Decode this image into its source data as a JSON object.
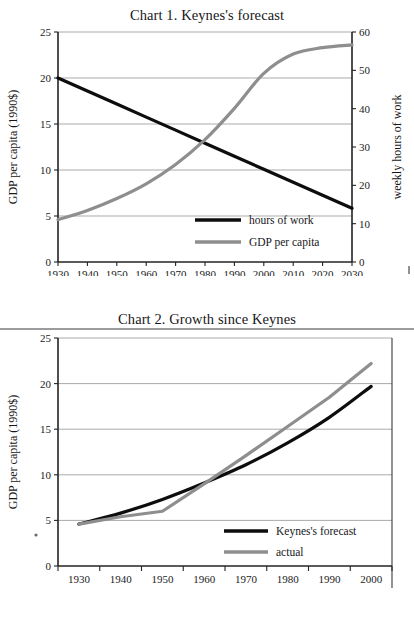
{
  "chart_data": [
    {
      "type": "line",
      "title": "Chart 1. Keynes's forecast",
      "xlabel": "",
      "ylabel": "GDP per capita (1990$)",
      "y2label": "weekly hours of work",
      "xlim": [
        1930,
        2030
      ],
      "ylim": [
        0,
        25
      ],
      "y2lim": [
        0,
        60
      ],
      "xticks": [
        1930,
        1940,
        1950,
        1960,
        1970,
        1980,
        1990,
        2000,
        2010,
        2020,
        2030
      ],
      "yticks": [
        0,
        5,
        10,
        15,
        20,
        25
      ],
      "y2ticks": [
        0,
        10,
        20,
        30,
        40,
        50,
        60
      ],
      "grid": "horizontal",
      "legend_position": "inside-bottom-center",
      "x": [
        1930,
        1940,
        1950,
        1960,
        1970,
        1980,
        1990,
        2000,
        2010,
        2020,
        2030
      ],
      "series": [
        {
          "name": "hours of work",
          "axis": "right",
          "color": "#0d0d0d",
          "units": "weekly hours",
          "values": [
            48.0,
            44.6,
            41.2,
            37.8,
            34.4,
            31.0,
            27.6,
            24.2,
            20.8,
            17.4,
            14.0
          ]
        },
        {
          "name": "GDP per capita",
          "axis": "left",
          "color": "#8e8e8e",
          "units": "1990$ thousands",
          "values": [
            4.6,
            5.6,
            6.9,
            8.5,
            10.6,
            13.3,
            16.7,
            20.5,
            22.6,
            23.3,
            23.6
          ]
        }
      ]
    },
    {
      "type": "line",
      "title": "Chart 2. Growth since Keynes",
      "xlabel": "",
      "ylabel": "GDP per capita (1990$)",
      "xlim": [
        1930,
        2000
      ],
      "ylim": [
        0,
        25
      ],
      "xticks": [
        1930,
        1940,
        1950,
        1960,
        1970,
        1980,
        1990,
        2000
      ],
      "yticks": [
        0,
        5,
        10,
        15,
        20,
        25
      ],
      "grid": "horizontal",
      "legend_position": "inside-bottom-center",
      "x": [
        1930,
        1940,
        1950,
        1960,
        1970,
        1980,
        1990,
        2000
      ],
      "series": [
        {
          "name": "Keynes's forecast",
          "color": "#0d0d0d",
          "units": "1990$ thousands",
          "values": [
            4.6,
            5.8,
            7.3,
            9.1,
            11.1,
            13.5,
            16.3,
            19.7
          ]
        },
        {
          "name": "actual",
          "color": "#8e8e8e",
          "units": "1990$ thousands",
          "values": [
            4.6,
            5.4,
            6.0,
            9.0,
            12.1,
            15.3,
            18.5,
            22.2
          ]
        }
      ]
    }
  ],
  "chart1": {
    "title": "Chart 1. Keynes's forecast",
    "y_axis_title": "GDP per capita (1990$)",
    "y2_axis_title": "weekly hours of work",
    "y_ticks": [
      "0",
      "5",
      "10",
      "15",
      "20",
      "25"
    ],
    "y2_ticks": [
      "0",
      "10",
      "20",
      "30",
      "40",
      "50",
      "60"
    ],
    "x_ticks": [
      "1930",
      "1940",
      "1950",
      "1960",
      "1970",
      "1980",
      "1990",
      "2000",
      "2010",
      "2020",
      "2030"
    ],
    "legend": [
      {
        "label": "hours of work",
        "color": "#0d0d0d"
      },
      {
        "label": "GDP per capita",
        "color": "#8e8e8e"
      }
    ]
  },
  "chart2": {
    "title": "Chart 2. Growth since Keynes",
    "y_axis_title": "GDP per capita (1990$)",
    "y_ticks": [
      "0",
      "5",
      "10",
      "15",
      "20",
      "25"
    ],
    "x_ticks": [
      "1930",
      "1940",
      "1950",
      "1960",
      "1970",
      "1980",
      "1990",
      "2000"
    ],
    "legend": [
      {
        "label": "Keynes's forecast",
        "color": "#0d0d0d"
      },
      {
        "label": "actual",
        "color": "#8e8e8e"
      }
    ]
  }
}
